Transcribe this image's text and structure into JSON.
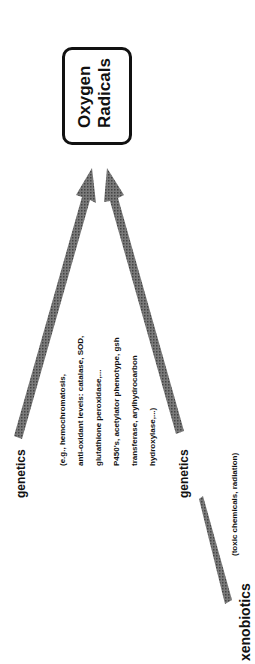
{
  "diagram": {
    "target": {
      "line1": "Oxygen",
      "line2": "Radicals"
    },
    "labels": {
      "genetics_top": "genetics",
      "genetics_bottom": "genetics",
      "xenobiotics": "xenobiotics",
      "xenobiotics_note": "(toxic chemicals, radiation)"
    },
    "examples": [
      "(e.g., hemochromatosis,",
      "anti-oxidant levels:  catalase, SOD,",
      "glutathione peroxidase,...",
      "P450's, acetylator phenotype, gsh",
      "transferase, arylhydrocarbon",
      "hydroxylase,...)"
    ],
    "colors": {
      "arrow": "#6e6e6e",
      "text": "#111111",
      "box_border": "#111111"
    },
    "orientation": "rotated -90 degrees"
  }
}
